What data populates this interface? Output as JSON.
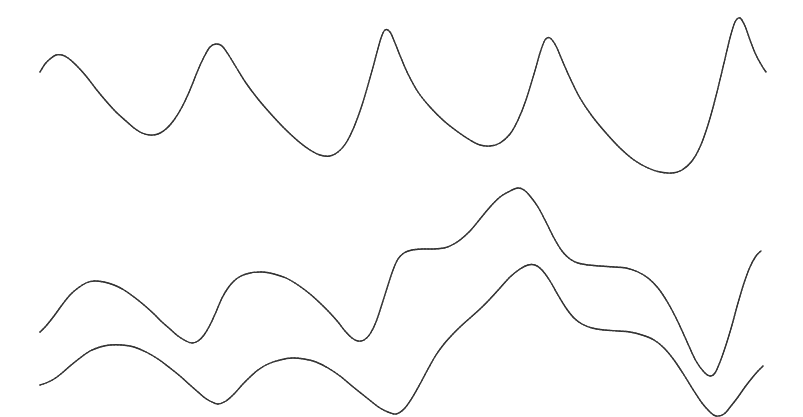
{
  "figure": {
    "title": "",
    "background_color": "#ffffff",
    "line_color": "#2b2b2b",
    "width_px": 803,
    "height_px": 417
  },
  "chart_data": {
    "type": "line",
    "title": "",
    "subtitle": "",
    "xlabel": "",
    "ylabel": "",
    "grid": false,
    "legend": false,
    "legend_position": "none",
    "axes_visible": false,
    "tick_labels_x": [],
    "tick_labels_y": [],
    "xlim": [
      0,
      803
    ],
    "ylim": [
      417,
      0
    ],
    "note": "Three smooth oscillating traces drawn in screen pixel coordinates (y increases downward). Rendering is anti-aliased / intermittently dotted, suggesting a faint or dashed pen.",
    "series": [
      {
        "name": "trace-top",
        "panel": "upper",
        "style": "solid-intermittent",
        "color": "#2b2b2b",
        "points": [
          [
            40,
            72
          ],
          [
            45,
            64
          ],
          [
            50,
            59
          ],
          [
            56,
            55
          ],
          [
            62,
            55
          ],
          [
            68,
            58
          ],
          [
            76,
            65
          ],
          [
            86,
            76
          ],
          [
            96,
            89
          ],
          [
            106,
            101
          ],
          [
            116,
            112
          ],
          [
            126,
            121
          ],
          [
            134,
            128
          ],
          [
            142,
            133
          ],
          [
            150,
            135
          ],
          [
            158,
            134
          ],
          [
            166,
            129
          ],
          [
            174,
            120
          ],
          [
            182,
            107
          ],
          [
            190,
            90
          ],
          [
            198,
            70
          ],
          [
            204,
            57
          ],
          [
            210,
            47
          ],
          [
            216,
            44
          ],
          [
            222,
            46
          ],
          [
            228,
            54
          ],
          [
            236,
            67
          ],
          [
            246,
            83
          ],
          [
            258,
            99
          ],
          [
            270,
            113
          ],
          [
            284,
            128
          ],
          [
            298,
            141
          ],
          [
            310,
            150
          ],
          [
            320,
            155
          ],
          [
            330,
            156
          ],
          [
            338,
            152
          ],
          [
            346,
            143
          ],
          [
            354,
            127
          ],
          [
            362,
            105
          ],
          [
            370,
            78
          ],
          [
            376,
            56
          ],
          [
            381,
            38
          ],
          [
            385,
            30
          ],
          [
            390,
            32
          ],
          [
            395,
            43
          ],
          [
            401,
            58
          ],
          [
            408,
            74
          ],
          [
            418,
            92
          ],
          [
            430,
            107
          ],
          [
            444,
            121
          ],
          [
            458,
            132
          ],
          [
            470,
            140
          ],
          [
            480,
            145
          ],
          [
            490,
            146
          ],
          [
            500,
            143
          ],
          [
            510,
            134
          ],
          [
            518,
            120
          ],
          [
            526,
            100
          ],
          [
            534,
            74
          ],
          [
            540,
            53
          ],
          [
            545,
            40
          ],
          [
            550,
            38
          ],
          [
            556,
            46
          ],
          [
            562,
            60
          ],
          [
            570,
            78
          ],
          [
            580,
            98
          ],
          [
            592,
            116
          ],
          [
            606,
            133
          ],
          [
            620,
            148
          ],
          [
            634,
            160
          ],
          [
            648,
            168
          ],
          [
            660,
            172
          ],
          [
            672,
            173
          ],
          [
            682,
            170
          ],
          [
            692,
            161
          ],
          [
            700,
            147
          ],
          [
            708,
            125
          ],
          [
            716,
            96
          ],
          [
            724,
            63
          ],
          [
            730,
            38
          ],
          [
            735,
            22
          ],
          [
            740,
            18
          ],
          [
            745,
            26
          ],
          [
            750,
            40
          ],
          [
            756,
            55
          ],
          [
            762,
            66
          ],
          [
            766,
            72
          ]
        ]
      },
      {
        "name": "trace-bottom-upper",
        "panel": "lower",
        "style": "solid-intermittent",
        "color": "#2b2b2b",
        "points": [
          [
            40,
            332
          ],
          [
            46,
            326
          ],
          [
            54,
            316
          ],
          [
            62,
            305
          ],
          [
            70,
            295
          ],
          [
            78,
            288
          ],
          [
            86,
            283
          ],
          [
            94,
            281
          ],
          [
            104,
            282
          ],
          [
            114,
            285
          ],
          [
            124,
            290
          ],
          [
            134,
            297
          ],
          [
            144,
            305
          ],
          [
            154,
            314
          ],
          [
            162,
            322
          ],
          [
            170,
            329
          ],
          [
            178,
            336
          ],
          [
            186,
            341
          ],
          [
            192,
            343
          ],
          [
            198,
            341
          ],
          [
            204,
            335
          ],
          [
            210,
            325
          ],
          [
            216,
            312
          ],
          [
            222,
            298
          ],
          [
            228,
            288
          ],
          [
            234,
            281
          ],
          [
            241,
            276
          ],
          [
            250,
            273
          ],
          [
            262,
            272
          ],
          [
            274,
            274
          ],
          [
            286,
            278
          ],
          [
            298,
            285
          ],
          [
            310,
            294
          ],
          [
            320,
            303
          ],
          [
            330,
            313
          ],
          [
            338,
            322
          ],
          [
            345,
            331
          ],
          [
            352,
            338
          ],
          [
            358,
            341
          ],
          [
            364,
            340
          ],
          [
            370,
            334
          ],
          [
            376,
            322
          ],
          [
            382,
            304
          ],
          [
            388,
            285
          ],
          [
            393,
            270
          ],
          [
            398,
            259
          ],
          [
            404,
            253
          ],
          [
            412,
            250
          ],
          [
            422,
            249
          ],
          [
            434,
            249
          ],
          [
            444,
            248
          ],
          [
            452,
            245
          ],
          [
            460,
            240
          ],
          [
            470,
            231
          ],
          [
            480,
            219
          ],
          [
            490,
            207
          ],
          [
            500,
            197
          ],
          [
            510,
            191
          ],
          [
            518,
            188
          ],
          [
            524,
            190
          ],
          [
            530,
            196
          ],
          [
            538,
            207
          ],
          [
            546,
            222
          ],
          [
            554,
            238
          ],
          [
            562,
            251
          ],
          [
            570,
            259
          ],
          [
            578,
            263
          ],
          [
            588,
            265
          ],
          [
            600,
            266
          ],
          [
            614,
            267
          ],
          [
            626,
            268
          ],
          [
            638,
            272
          ],
          [
            648,
            278
          ],
          [
            658,
            288
          ],
          [
            668,
            303
          ],
          [
            678,
            322
          ],
          [
            688,
            344
          ],
          [
            696,
            361
          ],
          [
            704,
            372
          ],
          [
            710,
            376
          ],
          [
            715,
            373
          ],
          [
            720,
            362
          ],
          [
            726,
            345
          ],
          [
            732,
            325
          ],
          [
            738,
            303
          ],
          [
            744,
            283
          ],
          [
            750,
            267
          ],
          [
            756,
            256
          ],
          [
            761,
            251
          ]
        ]
      },
      {
        "name": "trace-bottom-lower",
        "panel": "lower",
        "style": "solid-intermittent",
        "color": "#2b2b2b",
        "points": [
          [
            40,
            385
          ],
          [
            46,
            383
          ],
          [
            54,
            379
          ],
          [
            62,
            373
          ],
          [
            70,
            366
          ],
          [
            80,
            358
          ],
          [
            90,
            351
          ],
          [
            100,
            347
          ],
          [
            110,
            345
          ],
          [
            122,
            345
          ],
          [
            134,
            347
          ],
          [
            146,
            352
          ],
          [
            158,
            359
          ],
          [
            170,
            368
          ],
          [
            180,
            376
          ],
          [
            190,
            385
          ],
          [
            198,
            392
          ],
          [
            205,
            398
          ],
          [
            212,
            402
          ],
          [
            218,
            404
          ],
          [
            226,
            401
          ],
          [
            234,
            394
          ],
          [
            242,
            385
          ],
          [
            250,
            377
          ],
          [
            258,
            370
          ],
          [
            268,
            364
          ],
          [
            280,
            360
          ],
          [
            292,
            358
          ],
          [
            304,
            359
          ],
          [
            316,
            362
          ],
          [
            328,
            368
          ],
          [
            340,
            376
          ],
          [
            352,
            386
          ],
          [
            362,
            394
          ],
          [
            372,
            402
          ],
          [
            380,
            408
          ],
          [
            388,
            412
          ],
          [
            396,
            414
          ],
          [
            404,
            409
          ],
          [
            412,
            398
          ],
          [
            420,
            384
          ],
          [
            428,
            369
          ],
          [
            436,
            355
          ],
          [
            444,
            344
          ],
          [
            452,
            335
          ],
          [
            460,
            327
          ],
          [
            470,
            318
          ],
          [
            480,
            309
          ],
          [
            490,
            299
          ],
          [
            500,
            288
          ],
          [
            510,
            277
          ],
          [
            520,
            269
          ],
          [
            528,
            265
          ],
          [
            535,
            265
          ],
          [
            542,
            270
          ],
          [
            550,
            281
          ],
          [
            558,
            295
          ],
          [
            566,
            308
          ],
          [
            574,
            318
          ],
          [
            582,
            324
          ],
          [
            592,
            328
          ],
          [
            604,
            330
          ],
          [
            618,
            331
          ],
          [
            630,
            332
          ],
          [
            642,
            335
          ],
          [
            654,
            340
          ],
          [
            664,
            348
          ],
          [
            674,
            360
          ],
          [
            684,
            375
          ],
          [
            694,
            391
          ],
          [
            702,
            403
          ],
          [
            710,
            412
          ],
          [
            716,
            416
          ],
          [
            724,
            414
          ],
          [
            731,
            406
          ],
          [
            738,
            397
          ],
          [
            745,
            387
          ],
          [
            752,
            378
          ],
          [
            758,
            371
          ],
          [
            763,
            366
          ]
        ]
      }
    ]
  },
  "render": {
    "stroke_width": 1.35,
    "smoothing": "catmull-rom",
    "segments_visible": "intermittent (faint/dotted in steep regions)"
  }
}
